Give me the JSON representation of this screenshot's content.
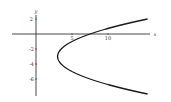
{
  "chart_data": {
    "type": "line",
    "title": "",
    "xlabel": "x",
    "ylabel": "y",
    "equation": "x = 3 + (y + 3)^2 / 2",
    "xlim": [
      -3.5,
      16
    ],
    "ylim": [
      -8.2,
      3
    ],
    "grid": false,
    "legend": null,
    "x_ticks": [
      {
        "value": 5,
        "label": "5"
      },
      {
        "value": 10,
        "label": "10"
      }
    ],
    "y_ticks": [
      {
        "value": 2,
        "label": "2"
      },
      {
        "value": -2,
        "label": "-2"
      },
      {
        "value": -4,
        "label": "-4"
      },
      {
        "value": -6,
        "label": "-6"
      }
    ],
    "series": [
      {
        "name": "parabola",
        "points": [
          {
            "x": 15.5,
            "y": 2.0
          },
          {
            "x": 11.0,
            "y": 1.0
          },
          {
            "x": 7.5,
            "y": 0.0
          },
          {
            "x": 5.0,
            "y": -1.0
          },
          {
            "x": 3.5,
            "y": -2.0
          },
          {
            "x": 3.0,
            "y": -3.0
          },
          {
            "x": 3.5,
            "y": -4.0
          },
          {
            "x": 5.0,
            "y": -5.0
          },
          {
            "x": 7.5,
            "y": -6.0
          },
          {
            "x": 11.0,
            "y": -7.0
          },
          {
            "x": 15.5,
            "y": -8.0
          }
        ]
      }
    ],
    "colors": {
      "curve": "#1a1a1a",
      "axes": "#333333"
    }
  },
  "labels": {
    "x_axis": "x",
    "y_axis": "y",
    "x_tick_5": "5",
    "x_tick_10": "10",
    "y_tick_2": "2",
    "y_tick_m2": "-2",
    "y_tick_m4": "-4",
    "y_tick_m6": "-6"
  }
}
